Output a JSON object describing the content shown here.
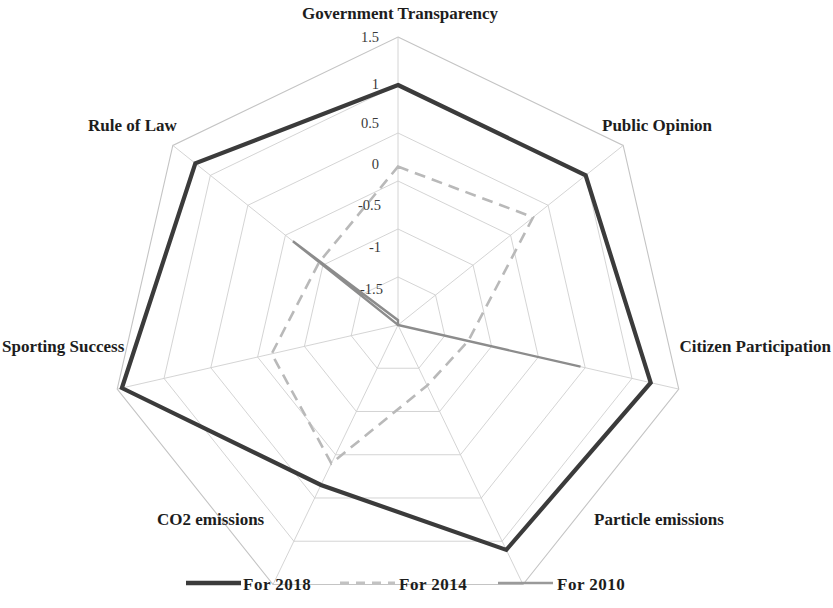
{
  "chart_data": {
    "type": "radar",
    "title": "",
    "categories": [
      "Government Transparency",
      "Public Opinion",
      "Citizen Participation",
      "Particle emissions",
      "CO2 emissions",
      "Sporting Success",
      "Rule of Law"
    ],
    "series": [
      {
        "name": "For 2018",
        "color": "#3b3b3b",
        "style": "solid-thick",
        "values": [
          1.0,
          1.0,
          1.2,
          1.1,
          0.35,
          1.45,
          1.2
        ]
      },
      {
        "name": "For 2014",
        "color": "#b9b9b9",
        "style": "dashed",
        "values": [
          0.15,
          0.3,
          -0.75,
          -0.8,
          0.1,
          -0.15,
          -0.45
        ]
      },
      {
        "name": "For 2010",
        "color": "#8c8c8c",
        "style": "solid-thin",
        "values": [
          -1.45,
          -1.5,
          0.45,
          -1.5,
          -1.5,
          -1.5,
          -0.1
        ]
      }
    ],
    "tick_labels": [
      "1.5",
      "1",
      "0.5",
      "0",
      "-0.5",
      "-1",
      "-1.5"
    ],
    "tick_values": [
      1.5,
      1.0,
      0.5,
      0.0,
      -0.5,
      -1.0,
      -1.5
    ],
    "rlim": [
      -1.5,
      1.5
    ],
    "grid": true,
    "legend_position": "bottom",
    "xlabel": "",
    "ylabel": ""
  },
  "axis_labels": {
    "government_transparency": "Government Transparency",
    "public_opinion": "Public Opinion",
    "citizen_participation": "Citizen Participation",
    "particle_emissions": "Particle emissions",
    "co2_emissions": "CO2 emissions",
    "sporting_success": "Sporting Success",
    "rule_of_law": "Rule of Law"
  },
  "ticks": {
    "t0": "1.5",
    "t1": "1",
    "t2": "0.5",
    "t3": "0",
    "t4": "-0.5",
    "t5": "-1",
    "t6": "-1.5"
  },
  "legend": {
    "items": [
      {
        "label": "For 2018"
      },
      {
        "label": "For 2014"
      },
      {
        "label": "For 2010"
      }
    ]
  }
}
